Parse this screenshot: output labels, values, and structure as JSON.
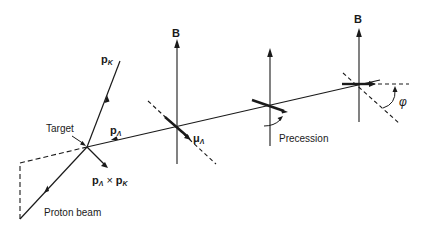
{
  "diagram": {
    "labels": {
      "pK": "p",
      "pK_sub": "K",
      "target": "Target",
      "pLambda": "p",
      "pLambda_sub": "Λ",
      "muLambda": "μ",
      "muLambda_sub": "Λ",
      "cross_a": "p",
      "cross_a_sub": "Λ",
      "cross_op": "×",
      "cross_b": "p",
      "cross_b_sub": "K",
      "proton_beam": "Proton beam",
      "B1": "B",
      "B3": "B",
      "precession": "Precession",
      "phi": "φ"
    },
    "colors": {
      "ink": "#1a1a1a",
      "background": "#ffffff"
    }
  }
}
